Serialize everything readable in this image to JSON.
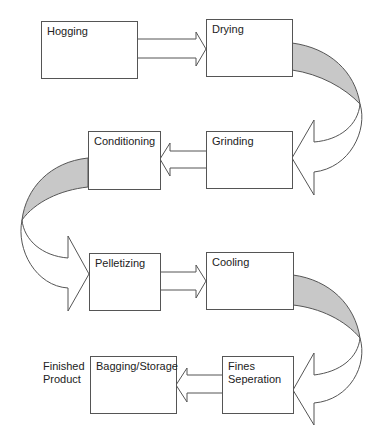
{
  "diagram": {
    "type": "process-flow",
    "steps": [
      {
        "id": "hogging",
        "label": "Hogging"
      },
      {
        "id": "drying",
        "label": "Drying"
      },
      {
        "id": "grinding",
        "label": "Grinding"
      },
      {
        "id": "conditioning",
        "label": "Conditioning"
      },
      {
        "id": "pelletizing",
        "label": "Pelletizing"
      },
      {
        "id": "cooling",
        "label": "Cooling"
      },
      {
        "id": "fines",
        "label_line1": "Fines",
        "label_line2": "Seperation"
      },
      {
        "id": "bagging",
        "label": "Bagging/Storage"
      }
    ],
    "output_label": {
      "line1": "Finished",
      "line2": "Product"
    },
    "flow": [
      "Hogging",
      "Drying",
      "Grinding",
      "Conditioning",
      "Pelletizing",
      "Cooling",
      "Fines Seperation",
      "Bagging/Storage"
    ],
    "colors": {
      "stroke": "#555555",
      "shade": "#c8c8c8",
      "fill": "#ffffff"
    }
  }
}
